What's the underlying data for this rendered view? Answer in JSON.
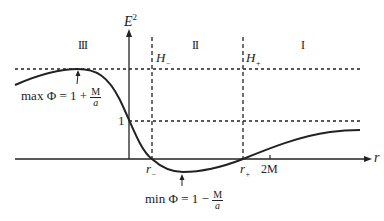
{
  "diagram": {
    "axes": {
      "y_label": "E",
      "y_label_sup": "2",
      "x_label": "r"
    },
    "regions": [
      "III",
      "II",
      "I"
    ],
    "horizons": {
      "inner": {
        "name": "H",
        "sub": "−"
      },
      "outer": {
        "name": "H",
        "sub": "+"
      }
    },
    "ticks": {
      "y_one": "1",
      "r_minus": {
        "name": "r",
        "sub": "−"
      },
      "r_plus": {
        "name": "r",
        "sub": "+"
      },
      "two_m": "2M"
    },
    "annotations": {
      "max": {
        "prefix": "max Φ = 1 + ",
        "num": "M",
        "den": "a"
      },
      "min": {
        "prefix": "min Φ = 1 − ",
        "num": "M",
        "den": "a"
      }
    },
    "colors": {
      "line": "#222222",
      "background": "#ffffff"
    }
  }
}
